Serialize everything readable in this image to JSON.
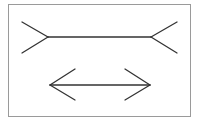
{
  "diagram": {
    "type": "muller-lyer-illusion",
    "frame": {
      "x": 8,
      "y": 4,
      "width": 183,
      "height": 113,
      "border_color": "#9a9a9a"
    },
    "stroke_color": "#333333",
    "stroke_width": 1.3,
    "figures": [
      {
        "name": "fins-outward-line",
        "shaft": {
          "x1": 48,
          "y1": 37,
          "x2": 151,
          "y2": 37
        },
        "left_fins": [
          {
            "x1": 48,
            "y1": 37,
            "x2": 22,
            "y2": 22
          },
          {
            "x1": 48,
            "y1": 37,
            "x2": 22,
            "y2": 53
          }
        ],
        "right_fins": [
          {
            "x1": 151,
            "y1": 37,
            "x2": 177,
            "y2": 22
          },
          {
            "x1": 151,
            "y1": 37,
            "x2": 177,
            "y2": 53
          }
        ]
      },
      {
        "name": "arrowheads-inward-line",
        "shaft": {
          "x1": 50,
          "y1": 85,
          "x2": 150,
          "y2": 85
        },
        "left_fins": [
          {
            "x1": 50,
            "y1": 85,
            "x2": 75,
            "y2": 69
          },
          {
            "x1": 50,
            "y1": 85,
            "x2": 75,
            "y2": 100
          }
        ],
        "right_fins": [
          {
            "x1": 150,
            "y1": 85,
            "x2": 125,
            "y2": 69
          },
          {
            "x1": 150,
            "y1": 85,
            "x2": 125,
            "y2": 100
          }
        ]
      }
    ]
  }
}
